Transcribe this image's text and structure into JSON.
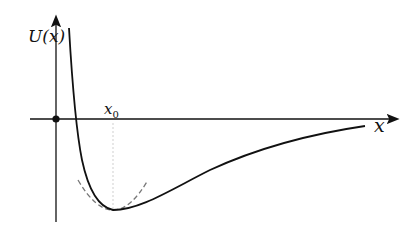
{
  "diagram": {
    "type": "potential-energy-curve",
    "y_axis_label": "U(x)",
    "x_axis_label": "x",
    "equilibrium_label": "x",
    "equilibrium_subscript": "0",
    "elements": [
      "y-axis arrow",
      "x-axis arrow",
      "origin dot",
      "solid potential curve U(x) (Lennard-Jones/Morse-like)",
      "dashed parabolic approximation near minimum",
      "dotted vertical line at x0 to minimum"
    ],
    "colors": {
      "axes": "#111111",
      "curve": "#111111",
      "parabola": "#777777",
      "guide": "#cccccc"
    }
  }
}
